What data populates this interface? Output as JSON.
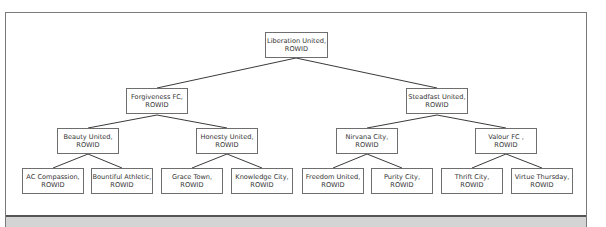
{
  "diagram": {
    "type": "tree",
    "suffix": "ROWID",
    "nodes": [
      {
        "id": "n0",
        "label": "Liberation United,",
        "sub": "ROWID",
        "level": 0
      },
      {
        "id": "n1",
        "label": "Forgiveness FC,",
        "sub": "ROWID",
        "level": 1,
        "parent": "n0"
      },
      {
        "id": "n2",
        "label": "Steadfast United,",
        "sub": "ROWID",
        "level": 1,
        "parent": "n0"
      },
      {
        "id": "n3",
        "label": "Beauty United,",
        "sub": "ROWID",
        "level": 2,
        "parent": "n1"
      },
      {
        "id": "n4",
        "label": "Honesty United,",
        "sub": "ROWID",
        "level": 2,
        "parent": "n1"
      },
      {
        "id": "n5",
        "label": "Nirvana City,",
        "sub": "ROWID",
        "level": 2,
        "parent": "n2"
      },
      {
        "id": "n6",
        "label": "Valour FC ,",
        "sub": "ROWID",
        "level": 2,
        "parent": "n2"
      },
      {
        "id": "n7",
        "label": "AC Compassion,",
        "sub": "ROWID",
        "level": 3,
        "parent": "n3"
      },
      {
        "id": "n8",
        "label": "Bountiful Athletic,",
        "sub": "ROWID",
        "level": 3,
        "parent": "n3"
      },
      {
        "id": "n9",
        "label": "Grace Town,",
        "sub": "ROWID",
        "level": 3,
        "parent": "n4"
      },
      {
        "id": "n10",
        "label": "Knowledge City,",
        "sub": "ROWID",
        "level": 3,
        "parent": "n4"
      },
      {
        "id": "n11",
        "label": "Freedom United,",
        "sub": "ROWID",
        "level": 3,
        "parent": "n5"
      },
      {
        "id": "n12",
        "label": "Purity City,",
        "sub": "ROWID",
        "level": 3,
        "parent": "n5"
      },
      {
        "id": "n13",
        "label": "Thrift City,",
        "sub": "ROWID",
        "level": 3,
        "parent": "n6"
      },
      {
        "id": "n14",
        "label": "Virtue Thursday,",
        "sub": "ROWID",
        "level": 3,
        "parent": "n6"
      }
    ]
  },
  "colors": {
    "border": "#6e6e6e",
    "text": "#333333",
    "panel": "#d4d4d4",
    "panel_border": "#555555"
  }
}
